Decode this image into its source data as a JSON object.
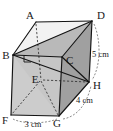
{
  "figure": {
    "name": "cuboid-prism-diagram",
    "type": "3d-solid-geometry",
    "solid": "rectangular prism with diagonal plane",
    "vertices": [
      {
        "id": "A",
        "label": "A",
        "x": 36,
        "y": 22,
        "hidden": false
      },
      {
        "id": "B",
        "label": "B",
        "x": 13,
        "y": 55,
        "hidden": false
      },
      {
        "id": "C",
        "label": "C",
        "x": 62,
        "y": 57,
        "hidden": false
      },
      {
        "id": "D",
        "label": "D",
        "x": 92,
        "y": 21,
        "hidden": false
      },
      {
        "id": "E",
        "label": "E",
        "x": 41,
        "y": 80,
        "hidden": true
      },
      {
        "id": "F",
        "label": "F",
        "x": 11,
        "y": 115,
        "hidden": false
      },
      {
        "id": "G",
        "label": "G",
        "x": 59,
        "y": 116,
        "hidden": false
      },
      {
        "id": "H",
        "label": "H",
        "x": 89,
        "y": 82,
        "hidden": false
      }
    ],
    "dimensions": [
      {
        "id": "height",
        "label": "5 cm",
        "value": 5,
        "unit": "cm",
        "edge": "D-H",
        "x": 95,
        "y": 54
      },
      {
        "id": "depth",
        "label": "4 cm",
        "value": 4,
        "unit": "cm",
        "edge": "G-H",
        "x": 78,
        "y": 100
      },
      {
        "id": "width",
        "label": "3 cm",
        "value": 3,
        "unit": "cm",
        "edge": "F-G",
        "x": 24,
        "y": 124
      }
    ],
    "angle_marks": [
      {
        "id": "right-angle-at-B",
        "vertex": "B",
        "type": "right-angle",
        "x": 29,
        "y": 60
      }
    ],
    "colors": {
      "stroke": "#1a1a1a",
      "label": "#1a1a1a",
      "face_front": "#c9c9c9",
      "face_right": "#9e9e9e",
      "face_top": "#dcdcdc",
      "face_inner": "#efefef",
      "background": "#ffffff"
    }
  }
}
